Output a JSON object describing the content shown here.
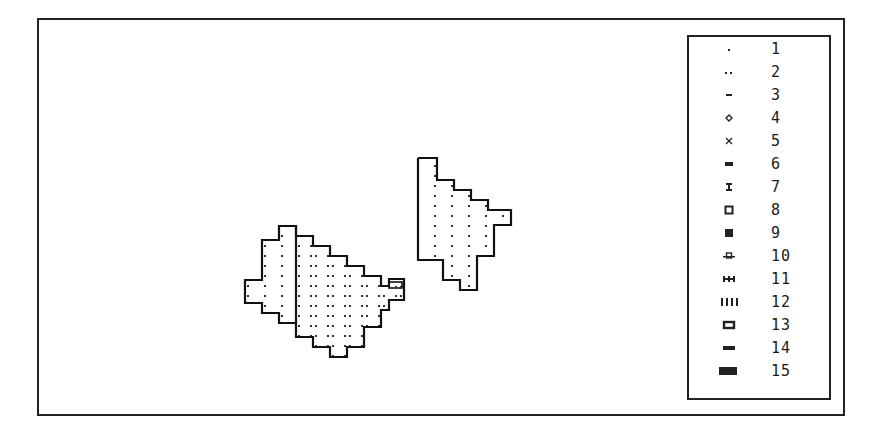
{
  "figure": {
    "shapes": [
      {
        "name": "left-region",
        "pattern": "dots"
      },
      {
        "name": "right-region",
        "pattern": "dots"
      }
    ]
  },
  "legend": {
    "items": [
      {
        "label": "1",
        "symbol": "single-dot"
      },
      {
        "label": "2",
        "symbol": "double-dot"
      },
      {
        "label": "3",
        "symbol": "short-dash"
      },
      {
        "label": "4",
        "symbol": "diamond-small"
      },
      {
        "label": "5",
        "symbol": "x-mark"
      },
      {
        "label": "6",
        "symbol": "small-bar"
      },
      {
        "label": "7",
        "symbol": "i-beam"
      },
      {
        "label": "8",
        "symbol": "hollow-square"
      },
      {
        "label": "9",
        "symbol": "filled-square"
      },
      {
        "label": "10",
        "symbol": "dashed-circle"
      },
      {
        "label": "11",
        "symbol": "triple-tick"
      },
      {
        "label": "12",
        "symbol": "four-bars"
      },
      {
        "label": "13",
        "symbol": "hollow-rectangle"
      },
      {
        "label": "14",
        "symbol": "long-dash"
      },
      {
        "label": "15",
        "symbol": "filled-rectangle"
      }
    ]
  }
}
